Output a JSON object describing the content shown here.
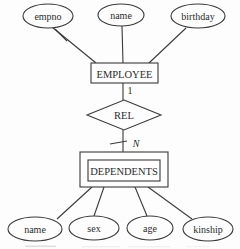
{
  "diagram": {
    "type": "er-diagram",
    "colors": {
      "line": "#3a3a3a",
      "text": "#2b2b2b",
      "background": "#fdfdfd"
    },
    "employee_attributes": [
      {
        "label": "empno",
        "is_key": true
      },
      {
        "label": "name",
        "is_key": false
      },
      {
        "label": "birthday",
        "is_key": false
      }
    ],
    "entities": [
      {
        "label": "EMPLOYEE",
        "kind": "strong"
      },
      {
        "label": "DEPENDENTS",
        "kind": "weak-double-border"
      }
    ],
    "relationship": {
      "label": "REL",
      "cardinality_near_employee": "1",
      "cardinality_near_dependents": "N"
    },
    "dependents_attributes": [
      {
        "label": "name"
      },
      {
        "label": "sex"
      },
      {
        "label": "age"
      },
      {
        "label": "kinship"
      }
    ]
  }
}
